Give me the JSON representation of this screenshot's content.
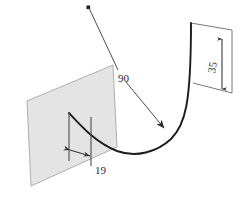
{
  "drawing": {
    "title": "Isometric sketch of a curved sheet-metal bend with dimensions",
    "background_color": "#ffffff",
    "line_color": "#3a3a3a",
    "curve_color": "#1a1a1a",
    "plane_fill": "#e4e4e4",
    "plane_stroke": "#9a9a9a",
    "text_color": "#2b2b2b"
  },
  "dimensions": [
    {
      "id": "bend-angle",
      "label": "90",
      "kind": "leader",
      "x": 122,
      "y": 78,
      "rotation": 0,
      "leader": {
        "origin_dot": {
          "x": 88,
          "y": 7
        },
        "elbow": {
          "x": 118,
          "y": 70
        },
        "arrow_tip": {
          "x": 164,
          "y": 128
        }
      }
    },
    {
      "id": "flange-height",
      "label": "35",
      "kind": "linear-vertical",
      "x": 217,
      "y": 64,
      "rotation": -80,
      "extent": {
        "top_y": 39,
        "bottom_y": 89,
        "x": 222
      }
    },
    {
      "id": "web-width",
      "label": "19",
      "kind": "linear-horizontal",
      "x": 97,
      "y": 170,
      "rotation": 0,
      "extent": {
        "left_x": 69,
        "right_x": 91,
        "y": 150
      }
    }
  ],
  "geometry": {
    "back_plane": {
      "name": "vertical-reference-plane",
      "points": "27,101 113,65 117,147 31,186"
    },
    "right_plane": {
      "name": "flange-reference-plane",
      "points": "191,23 232,30 232,93 193,83"
    },
    "curve_path": "M 69,113 C 82,126 96,143 118,152 C 136,159 158,153 172,139 C 186,125 191,104 191,23",
    "left_extension_lines": [
      {
        "x1": 69,
        "y1": 113,
        "x2": 69,
        "y2": 161
      },
      {
        "x1": 91,
        "y1": 117,
        "x2": 91,
        "y2": 165
      }
    ],
    "right_extension_lines": [
      {
        "x1": 191,
        "y1": 23,
        "x2": 232,
        "y2": 30
      },
      {
        "x1": 193,
        "y1": 83,
        "x2": 232,
        "y2": 93
      }
    ]
  }
}
